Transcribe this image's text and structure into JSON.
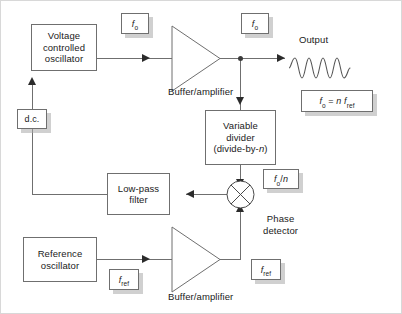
{
  "diagram": {
    "stroke_color": "#6f6f6f",
    "arrow_color": "#2b2b2b",
    "shadow_color": "#aaaaaa",
    "background": "#ffffff"
  },
  "blocks": {
    "vco": {
      "line1": "Voltage",
      "line2": "controlled",
      "line3": "oscillator"
    },
    "variable_divider": {
      "line1": "Variable",
      "line2": "divider",
      "line3_pre": "(divide-by-",
      "line3_var": "n",
      "line3_post": ")"
    },
    "low_pass_filter": {
      "line1": "Low-pass",
      "line2": "filter"
    },
    "reference_oscillator": {
      "line1": "Reference",
      "line2": "oscillator"
    }
  },
  "labels": {
    "buffer_amplifier_top": "Buffer/amplifier",
    "buffer_amplifier_bottom": "Buffer/amplifier",
    "output": "Output",
    "phase_detector_line1": "Phase",
    "phase_detector_line2": "detector"
  },
  "tags": {
    "fo_vco_out": {
      "var": "f",
      "sub": "o"
    },
    "fo_amp_out": {
      "var": "f",
      "sub": "o"
    },
    "dc": {
      "text": "d.c."
    },
    "fo_over_n": {
      "var": "f",
      "sub": "o",
      "suffix": "/",
      "suffix_var": "n"
    },
    "fref_osc_out": {
      "var": "f",
      "sub": "ref"
    },
    "fref_amp_out": {
      "var": "f",
      "sub": "ref"
    },
    "equation": {
      "lhs_var": "f",
      "lhs_sub": "o",
      "eq": " = ",
      "n": "n",
      "rhs_var": "f",
      "rhs_sub": "ref"
    }
  },
  "waveform": {
    "cycles": 4,
    "shape": "sine",
    "path": "M0,11 C2,11 3,1 6,1 C9,1 10,21 13,21 C16,21 17,1 20,1 C23,1 24,21 27,21 C30,21 31,1 34,1 C37,1 38,21 41,21 C44,21 45,1 48,1 C51,1 52,21 55,21 C58,21 59,11 61,11"
  }
}
